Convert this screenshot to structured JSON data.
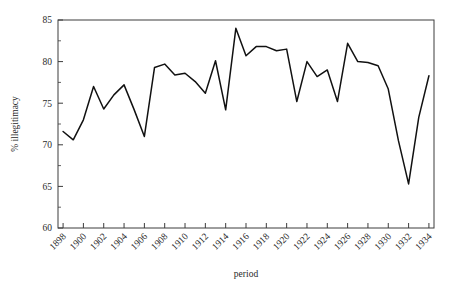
{
  "chart_data": {
    "type": "line",
    "title": "",
    "xlabel": "period",
    "ylabel": "% illegitimacy",
    "xlim": [
      1897.5,
      1934.5
    ],
    "ylim": [
      60,
      85
    ],
    "grid": false,
    "legend": false,
    "x": [
      1898,
      1899,
      1900,
      1901,
      1902,
      1903,
      1904,
      1905,
      1906,
      1907,
      1908,
      1909,
      1910,
      1911,
      1912,
      1913,
      1914,
      1915,
      1916,
      1917,
      1918,
      1919,
      1920,
      1921,
      1922,
      1923,
      1924,
      1925,
      1926,
      1927,
      1928,
      1929,
      1930,
      1931,
      1932,
      1933,
      1934
    ],
    "values": [
      71.6,
      70.6,
      73.0,
      77.0,
      74.3,
      76.0,
      77.2,
      74.2,
      71.0,
      79.3,
      79.7,
      78.4,
      78.6,
      77.6,
      76.2,
      80.1,
      74.2,
      84.0,
      80.7,
      81.8,
      81.8,
      81.3,
      81.5,
      75.2,
      80.0,
      78.2,
      79.0,
      75.2,
      82.2,
      80.0,
      79.9,
      79.5,
      76.7,
      70.5,
      65.3,
      73.3,
      78.3
    ],
    "y_ticks_major": [
      60,
      65,
      70,
      75,
      80,
      85
    ],
    "y_ticks_minor": [
      62.5,
      67.5,
      72.5,
      77.5,
      82.5
    ],
    "x_ticks_labeled": [
      1898,
      1900,
      1902,
      1904,
      1906,
      1908,
      1910,
      1912,
      1914,
      1916,
      1918,
      1920,
      1922,
      1924,
      1926,
      1928,
      1930,
      1932,
      1934
    ],
    "x_tick_labels": [
      "1898",
      "1900",
      "1902",
      "1904",
      "1906",
      "1908",
      "1910",
      "1912",
      "1914",
      "1916",
      "1918",
      "1920",
      "1922",
      "1924",
      "1926",
      "1928",
      "1930",
      "1932",
      "1934"
    ],
    "line_color": "#111111",
    "axis_color": "#3c3c3c"
  },
  "axes": {
    "x_title": "period",
    "y_title": "% illegitimacy"
  }
}
